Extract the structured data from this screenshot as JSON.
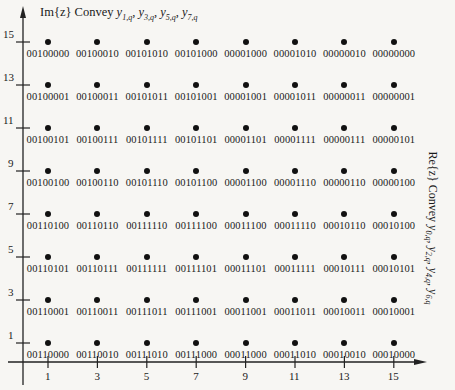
{
  "figure": {
    "y_axis_title": {
      "prefix": "Im{z} Convey ",
      "terms": [
        {
          "var": "y",
          "sub": "1,q"
        },
        {
          "var": "y",
          "sub": "3,q"
        },
        {
          "var": "y",
          "sub": "5,q"
        },
        {
          "var": "y",
          "sub": "7,q"
        }
      ]
    },
    "x_axis_title": {
      "prefix": "Re{z} Convey ",
      "terms": [
        {
          "var": "y",
          "sub": "0,q"
        },
        {
          "var": "y",
          "sub": "2,q"
        },
        {
          "var": "y",
          "sub": "4,q"
        },
        {
          "var": "y",
          "sub": "6,q"
        }
      ]
    },
    "x_ticks": [
      "1",
      "3",
      "5",
      "7",
      "9",
      "11",
      "13",
      "15"
    ],
    "y_ticks": [
      "15",
      "13",
      "11",
      "9",
      "7",
      "5",
      "3",
      "1"
    ],
    "marker_color": "#111111",
    "rows": [
      {
        "im": 15,
        "codes": [
          "00100000",
          "00100010",
          "00101010",
          "00101000",
          "00001000",
          "00001010",
          "00000010",
          "00000000"
        ]
      },
      {
        "im": 13,
        "codes": [
          "00100001",
          "00100011",
          "00101011",
          "00101001",
          "00001001",
          "00001011",
          "00000011",
          "00000001"
        ]
      },
      {
        "im": 11,
        "codes": [
          "00100101",
          "00100111",
          "00101111",
          "00101101",
          "00001101",
          "00001111",
          "00000111",
          "00000101"
        ]
      },
      {
        "im": 9,
        "codes": [
          "00100100",
          "00100110",
          "00101110",
          "00101100",
          "00001100",
          "00001110",
          "00000110",
          "00000100"
        ]
      },
      {
        "im": 7,
        "codes": [
          "00110100",
          "00110110",
          "00111110",
          "00111100",
          "00011100",
          "00011110",
          "00010110",
          "00010100"
        ]
      },
      {
        "im": 5,
        "codes": [
          "00110101",
          "00110111",
          "00111111",
          "00111101",
          "00011101",
          "00011111",
          "00010111",
          "00010101"
        ]
      },
      {
        "im": 3,
        "codes": [
          "00110001",
          "00110011",
          "00111011",
          "00111001",
          "00011001",
          "00011011",
          "00010011",
          "00010001"
        ]
      },
      {
        "im": 1,
        "codes": [
          "00110000",
          "00110010",
          "00111010",
          "00111000",
          "00011000",
          "00011010",
          "00010010",
          "00010000"
        ]
      }
    ]
  }
}
